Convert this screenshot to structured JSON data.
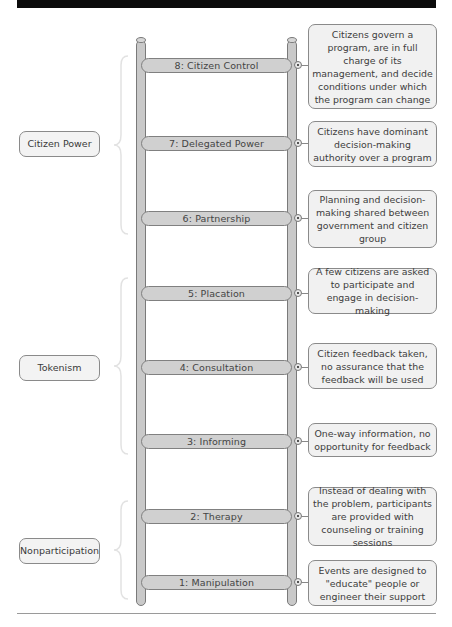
{
  "categories": [
    {
      "label": "Citizen Power",
      "rungs": [
        8,
        7,
        6
      ]
    },
    {
      "label": "Tokenism",
      "rungs": [
        5,
        4,
        3
      ]
    },
    {
      "label": "Nonparticipation",
      "rungs": [
        2,
        1
      ]
    }
  ],
  "rungs": [
    {
      "number": "8",
      "label": "8:  Citizen Control",
      "description": "Citizens govern a program, are in full charge of its management, and decide conditions under which the program can change"
    },
    {
      "number": "7",
      "label": "7:  Delegated Power",
      "description": "Citizens have dominant decision-making authority over a program"
    },
    {
      "number": "6",
      "label": "6:  Partnership",
      "description": "Planning and decision-making shared between government and citizen group"
    },
    {
      "number": "5",
      "label": "5:  Placation",
      "description": "A few citizens are asked to participate and engage in decision-making"
    },
    {
      "number": "4",
      "label": "4:  Consultation",
      "description": "Citizen feedback taken, no assurance that the feedback will be used"
    },
    {
      "number": "3",
      "label": "3:  Informing",
      "description": "One-way information, no opportunity for feedback"
    },
    {
      "number": "2",
      "label": "2:  Therapy",
      "description": "Instead of dealing with the problem, participants are provided with counseling or training sessions"
    },
    {
      "number": "1",
      "label": "1:  Manipulation",
      "description": "Events are designed to \"educate\" people or engineer their support"
    }
  ],
  "colors": {
    "rail": "#c9c9c9",
    "rung": "#d0d0d0",
    "box": "#f1f1f1",
    "border": "#808080",
    "topbar": "#0b0b0b"
  }
}
